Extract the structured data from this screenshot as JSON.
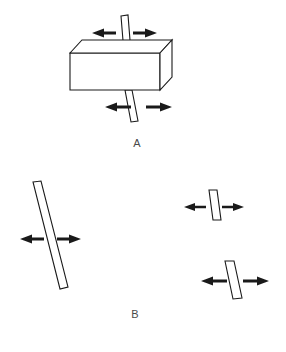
{
  "figure": {
    "background_color": "#ffffff",
    "line_color": "#1a1a1a",
    "label_color": "#4a4a4a",
    "width": 286,
    "height": 352,
    "type": "line-diagram"
  },
  "panels": [
    {
      "id": "panel-a",
      "label": "A",
      "label_x": 137,
      "label_y": 144,
      "block": {
        "name": "rectangular-block",
        "front_face": "70,53 160,53 160,90 70,90",
        "top_face": "70,53 82,40 172,40 160,53",
        "side_face": "160,53 172,40 172,77 160,90"
      },
      "rods": [
        {
          "name": "rod-top-segment",
          "points": "121,16 128,15 131,53 124,53"
        },
        {
          "name": "rod-bottom-segment",
          "points": "125,90 132,90 138,121 131,122"
        }
      ],
      "arrows": [
        {
          "name": "arrow-top-left",
          "direction": "left",
          "x": 92,
          "y": 33,
          "length": 24
        },
        {
          "name": "arrow-top-right",
          "direction": "right",
          "x": 133,
          "y": 33,
          "length": 24
        },
        {
          "name": "arrow-bottom-left",
          "direction": "left",
          "x": 105,
          "y": 107,
          "length": 26
        },
        {
          "name": "arrow-bottom-right",
          "direction": "right",
          "x": 146,
          "y": 107,
          "length": 26
        }
      ]
    },
    {
      "id": "panel-b",
      "label": "B",
      "label_x": 135,
      "label_y": 315,
      "rods": [
        {
          "name": "rod-large-left",
          "points": "33,182 41,181 68,287 60,289"
        },
        {
          "name": "rod-small-upper-right",
          "points": "209,190 217,190 221,220 213,220"
        },
        {
          "name": "rod-medium-lower-right",
          "points": "225,261 234,261 242,298 233,299"
        }
      ],
      "arrows": [
        {
          "name": "arrow-left-bar-left",
          "direction": "left",
          "x": 20,
          "y": 239,
          "length": 24
        },
        {
          "name": "arrow-left-bar-right",
          "direction": "right",
          "x": 57,
          "y": 239,
          "length": 24
        },
        {
          "name": "arrow-upper-right-left",
          "direction": "left",
          "x": 184,
          "y": 207,
          "length": 22
        },
        {
          "name": "arrow-upper-right-right",
          "direction": "right",
          "x": 222,
          "y": 207,
          "length": 22
        },
        {
          "name": "arrow-lower-right-left",
          "direction": "left",
          "x": 201,
          "y": 281,
          "length": 26
        },
        {
          "name": "arrow-lower-right-right",
          "direction": "right",
          "x": 243,
          "y": 281,
          "length": 26
        }
      ]
    }
  ]
}
